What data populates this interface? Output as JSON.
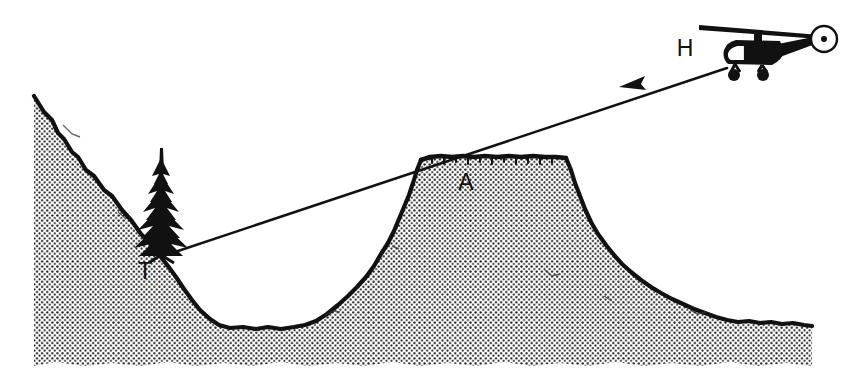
{
  "figure": {
    "style": "black-and-white stippled line drawing",
    "background_color": "#ffffff",
    "ink_color": "#111111"
  },
  "labels": [
    {
      "id": "helicopter-label",
      "text": "H",
      "meaning": "helicopter position",
      "x": 685,
      "y": 56
    },
    {
      "id": "ridge-label",
      "text": "A",
      "meaning": "mountain summit grazing point",
      "x": 466,
      "y": 190
    },
    {
      "id": "tree-label",
      "text": "T",
      "meaning": "tree / target at base of tree",
      "x": 145,
      "y": 279
    }
  ],
  "objects": {
    "helicopter": {
      "name": "helicopter",
      "body_center_x": 760,
      "body_center_y": 50,
      "rotor_span_left_x": 700,
      "rotor_span_right_x": 818,
      "tail_rotor_center_x": 824,
      "tail_rotor_center_y": 39,
      "tail_rotor_radius": 13
    },
    "tree": {
      "name": "conifer-tree",
      "trunk_base_x": 161,
      "trunk_base_y": 258,
      "tip_y": 148
    },
    "line_of_sight": {
      "name": "line-of-sight",
      "from_label": "H",
      "to_label": "T",
      "start_x": 727,
      "start_y": 68,
      "end_x": 163,
      "end_y": 256,
      "arrow_tip_x": 619,
      "arrow_tip_y": 87,
      "grazes_point": "A"
    }
  },
  "terrain": {
    "name": "stippled-terrain",
    "left_summit_x": 34,
    "left_summit_y": 96,
    "valley_floor_y": 328,
    "ridge_plateau_top_y": 156,
    "ridge_plateau_left_x": 420,
    "ridge_plateau_right_x": 566,
    "ground_base_y": 366,
    "right_edge_x": 812,
    "stipple_dot_color": "#1a1a1a",
    "stipple_spacing_px": 5
  }
}
